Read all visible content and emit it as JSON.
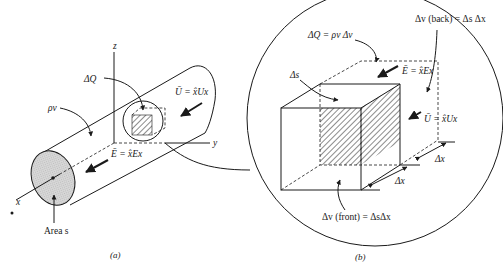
{
  "figure": {
    "panel_a": {
      "caption": "(a)",
      "labels": {
        "delta_q": "ΔQ",
        "rho": "ρv",
        "u_field": "Ū = x̂Ux",
        "e_field": "Ē = x̂Ex",
        "area": "Area s",
        "axis_x": "x",
        "axis_y": "y",
        "axis_z": "z"
      }
    },
    "panel_b": {
      "caption": "(b)",
      "labels": {
        "delta_q": "ΔQ = ρv Δv",
        "delta_v_back": "Δv (back) = Δs Δx",
        "delta_s": "Δs",
        "e_field": "Ē = x̂Ex",
        "u_field": "Ū = x̂Ux",
        "delta_x_1": "Δx",
        "delta_x_2": "Δx",
        "delta_v_front": "Δv (front) = ΔsΔx"
      }
    }
  }
}
